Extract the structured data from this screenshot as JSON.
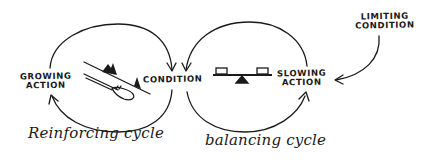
{
  "diagram": {
    "type": "causal-loop",
    "style": "hand-drawn sketch",
    "ink_color": "#1a1a1a",
    "background": "#ffffff",
    "nodes": {
      "growing_action": {
        "line1": "GROWING",
        "line2": "ACTION"
      },
      "condition": {
        "label": "CONDITION"
      },
      "slowing_action": {
        "line1": "SLOWING",
        "line2": "ACTION"
      },
      "limiting_condition": {
        "line1": "LIMITING",
        "line2": "CONDITION"
      }
    },
    "loops": {
      "reinforcing": {
        "caption": "Reinforcing cycle",
        "illustration": "snowball-rolling-downhill-icon"
      },
      "balancing": {
        "caption": "balancing cycle",
        "illustration": "balance-scale-icon"
      }
    },
    "edges": [
      {
        "from": "GROWING ACTION",
        "to": "CONDITION"
      },
      {
        "from": "CONDITION",
        "to": "GROWING ACTION"
      },
      {
        "from": "SLOWING ACTION",
        "to": "CONDITION"
      },
      {
        "from": "CONDITION",
        "to": "SLOWING ACTION"
      },
      {
        "from": "LIMITING CONDITION",
        "to": "SLOWING ACTION"
      }
    ]
  }
}
